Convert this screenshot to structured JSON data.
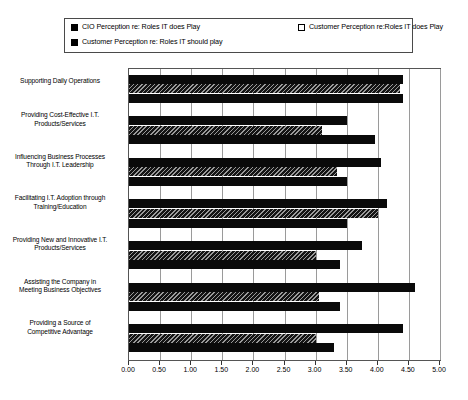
{
  "legend": {
    "items": [
      {
        "label": "CIO Perception re:  Roles IT does Play",
        "swatch": "black-filled-swatch",
        "color": "#0a0a0a"
      },
      {
        "label": "Customer Perception re:Roles IT does Play",
        "swatch": "white-hollow-swatch",
        "color": "#ffffff"
      },
      {
        "label": "Customer Perception re:  Roles IT should play",
        "swatch": "black-filled-swatch",
        "color": "#0a0a0a"
      }
    ]
  },
  "chart_data": {
    "type": "bar",
    "orientation": "horizontal",
    "title": "",
    "xlabel": "",
    "ylabel": "",
    "xlim": [
      0.0,
      5.0
    ],
    "xticks": [
      "0.00",
      "0.50",
      "1.00",
      "1.50",
      "2.00",
      "2.50",
      "3.00",
      "3.50",
      "4.00",
      "4.50",
      "5.00"
    ],
    "grid": true,
    "legend_position": "top",
    "categories": [
      "Supporting Daily Operations",
      "Providing Cost-Effective I.T. Products/Services",
      "Influencing Business Processes Through I.T. Leadership",
      "Facilitating I.T. Adoption through Training/Education",
      "Providing New and Innovative I.T. Products/Services",
      "Assisting the Company in Meeting Business Objectives",
      "Providing a Source of Competitive Advantage"
    ],
    "category_lines": [
      [
        "Supporting Daily Operations"
      ],
      [
        "Providing Cost-Effective I.T.",
        "Products/Services"
      ],
      [
        "Influencing Business Processes",
        "Through I.T. Leadership"
      ],
      [
        "Facilitating I.T. Adoption through",
        "Training/Education"
      ],
      [
        "Providing New and Innovative I.T.",
        "Products/Services"
      ],
      [
        "Assisting the Company in",
        "Meeting Business Objectives"
      ],
      [
        "Providing a Source of",
        "Competitive Advantage"
      ]
    ],
    "series": [
      {
        "name": "CIO Perception re:  Roles IT does Play",
        "values": [
          4.4,
          3.5,
          4.05,
          4.15,
          3.75,
          4.6,
          4.4
        ]
      },
      {
        "name": "Customer Perception re:Roles IT does Play",
        "values": [
          4.35,
          3.1,
          3.35,
          4.0,
          3.0,
          3.05,
          3.0
        ]
      },
      {
        "name": "Customer Perception re:  Roles IT should play",
        "values": [
          4.4,
          3.95,
          3.5,
          3.5,
          3.4,
          3.4,
          3.3
        ]
      }
    ]
  }
}
